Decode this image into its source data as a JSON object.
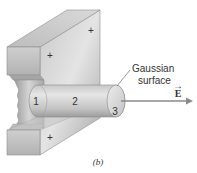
{
  "figure": {
    "caption": "(b)",
    "gaussian_label_line1": "Gaussian",
    "gaussian_label_line2": "surface",
    "field_label": "E",
    "field_arrow_glyph": "→",
    "cylinder_regions": [
      "1",
      "2",
      "3"
    ],
    "charge_marks": [
      "+",
      "+",
      "+"
    ]
  },
  "colors": {
    "slab_light": "#d6d6d6",
    "slab_mid": "#b9b9b9",
    "slab_dark": "#8f8f8f",
    "cylinder_light": "#e2e2e2",
    "cylinder_dark": "#a8a8a8",
    "arrow": "#8a8a8a",
    "text": "#333333"
  }
}
